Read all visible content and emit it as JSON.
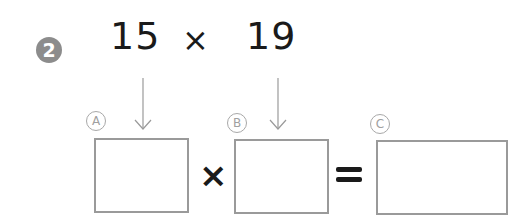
{
  "problem": {
    "number": "2",
    "operand_a": "15",
    "operator": "×",
    "operand_b": "19"
  },
  "answer_row": {
    "labels": [
      "Ⓐ",
      "Ⓑ",
      "Ⓒ"
    ],
    "label_letters": [
      "A",
      "B",
      "C"
    ],
    "times_symbol": "×",
    "equals_symbol": "="
  },
  "colors": {
    "badge": "#8c8c8c",
    "text": "#1a1a1a",
    "lines": "#9a9a9a"
  }
}
